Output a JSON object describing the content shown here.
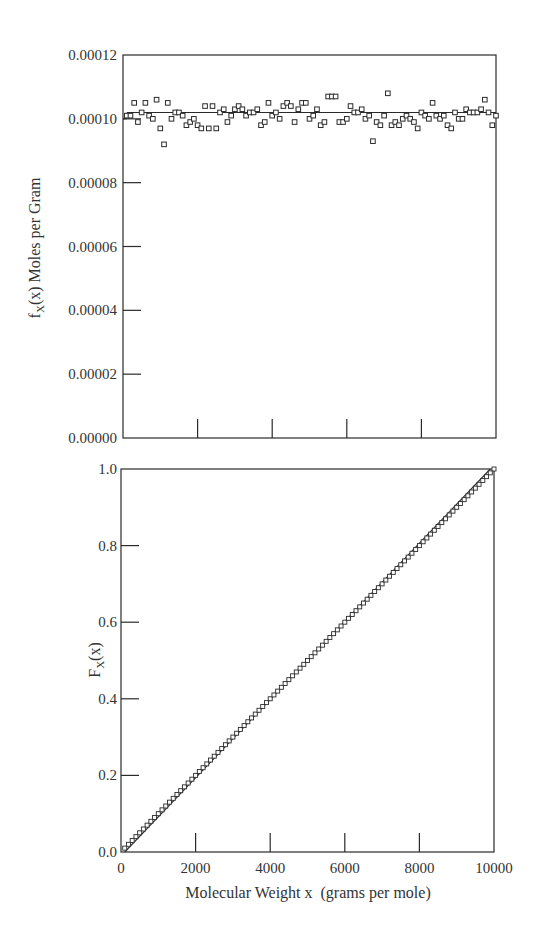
{
  "chart_data": [
    {
      "type": "scatter",
      "panel": "top",
      "title": "",
      "xlabel": "",
      "ylabel": "f_X(x) Moles per Gram",
      "ylabel_main": "f",
      "ylabel_sub": "X",
      "ylabel_rest": "(x) Moles per Gram",
      "xlim": [
        0,
        10000
      ],
      "ylim": [
        0,
        0.00012
      ],
      "yticks": [
        0.0,
        2e-05,
        4e-05,
        6e-05,
        8e-05,
        0.0001,
        0.00012
      ],
      "ytick_labels": [
        "0.00000",
        "0.00002",
        "0.00004",
        "0.00006",
        "0.00008",
        "0.00010",
        "0.00012"
      ],
      "xticks": [
        2000,
        4000,
        6000,
        8000
      ],
      "xtick_labels": [],
      "grid": false,
      "legend": null,
      "reference_line": {
        "y": 0.000102,
        "style": "solid",
        "note": "mean density line"
      },
      "reference_line_left_segment": {
        "x": [
          0,
          100
        ],
        "y": 0.0001
      },
      "series": [
        {
          "name": "sample density",
          "marker": "open-square",
          "x": [
            100,
            200,
            300,
            400,
            500,
            600,
            700,
            800,
            900,
            1000,
            1100,
            1200,
            1300,
            1400,
            1500,
            1600,
            1700,
            1800,
            1900,
            2000,
            2100,
            2200,
            2300,
            2400,
            2500,
            2600,
            2700,
            2800,
            2900,
            3000,
            3100,
            3200,
            3300,
            3400,
            3500,
            3600,
            3700,
            3800,
            3900,
            4000,
            4100,
            4200,
            4300,
            4400,
            4500,
            4600,
            4700,
            4800,
            4900,
            5000,
            5100,
            5200,
            5300,
            5400,
            5500,
            5600,
            5700,
            5800,
            5900,
            6000,
            6100,
            6200,
            6300,
            6400,
            6500,
            6600,
            6700,
            6800,
            6900,
            7000,
            7100,
            7200,
            7300,
            7400,
            7500,
            7600,
            7700,
            7800,
            7900,
            8000,
            8100,
            8200,
            8300,
            8400,
            8500,
            8600,
            8700,
            8800,
            8900,
            9000,
            9100,
            9200,
            9300,
            9400,
            9500,
            9600,
            9700,
            9800,
            9900,
            10000
          ],
          "values": [
            0.000101,
            0.000101,
            0.000105,
            9.9e-05,
            0.000102,
            0.000105,
            0.000101,
            0.0001,
            0.000106,
            9.7e-05,
            9.2e-05,
            0.000105,
            0.0001,
            0.000102,
            0.000102,
            0.000101,
            9.8e-05,
            9.9e-05,
            0.0001,
            9.8e-05,
            9.7e-05,
            0.000104,
            9.7e-05,
            0.000104,
            9.7e-05,
            0.000102,
            0.000103,
            9.9e-05,
            0.000101,
            0.000103,
            0.000104,
            0.000103,
            0.000101,
            0.000102,
            0.000102,
            0.000103,
            9.8e-05,
            9.9e-05,
            0.000105,
            0.000101,
            0.000102,
            0.0001,
            0.000104,
            0.000105,
            0.000104,
            9.9e-05,
            0.000103,
            0.000105,
            0.000105,
            0.0001,
            0.000101,
            0.000103,
            9.8e-05,
            9.9e-05,
            0.000107,
            0.000107,
            0.000107,
            9.9e-05,
            9.9e-05,
            0.0001,
            0.000104,
            0.000102,
            0.000102,
            0.000103,
            0.0001,
            0.000101,
            9.3e-05,
            9.9e-05,
            9.8e-05,
            0.000101,
            0.000108,
            9.8e-05,
            9.9e-05,
            9.8e-05,
            0.0001,
            0.000101,
            0.0001,
            9.9e-05,
            9.7e-05,
            0.000102,
            0.000101,
            0.0001,
            0.000105,
            0.000101,
            0.0001,
            0.000101,
            9.8e-05,
            9.7e-05,
            0.000102,
            0.0001,
            0.0001,
            0.000103,
            0.000102,
            0.000102,
            0.000102,
            0.000103,
            0.000106,
            0.000102,
            9.8e-05,
            0.000101
          ]
        }
      ]
    },
    {
      "type": "scatter",
      "panel": "bottom",
      "title": "",
      "xlabel": "Molecular Weight x  (grams per mole)",
      "ylabel": "F_X(x)",
      "ylabel_main": "F",
      "ylabel_sub": "X",
      "ylabel_rest": "(x)",
      "xlim": [
        0,
        10000
      ],
      "ylim": [
        0,
        1.0
      ],
      "yticks": [
        0.0,
        0.2,
        0.4,
        0.6,
        0.8,
        1.0
      ],
      "ytick_labels": [
        "0.0",
        "0.2",
        "0.4",
        "0.6",
        "0.8",
        "1.0"
      ],
      "xticks": [
        0,
        2000,
        4000,
        6000,
        8000,
        10000
      ],
      "xtick_labels": [
        "0",
        "2000",
        "4000",
        "6000",
        "8000",
        "10000"
      ],
      "grid": false,
      "legend": null,
      "reference_line": {
        "x": [
          100,
          9900
        ],
        "y": [
          0.0,
          1.0
        ],
        "style": "solid",
        "note": "theoretical CDF line"
      },
      "series": [
        {
          "name": "cumulative distribution",
          "marker": "open-square",
          "x_start": 100,
          "x_end": 10000,
          "x_step": 100,
          "y_start": 0.0101,
          "y_end": 1.0,
          "note": "approximately linear from (100, 0.01) to (10000, 1.0), lying slightly below the reference line near the top"
        }
      ]
    }
  ],
  "figure": {
    "top_panel": {
      "frame": {
        "left": 123,
        "top": 55,
        "right": 496,
        "bottom": 438
      }
    },
    "bottom_panel": {
      "frame": {
        "left": 121,
        "top": 469,
        "right": 494,
        "bottom": 852
      }
    },
    "colors": {
      "ink": "#2a2a2a",
      "background": "#ffffff"
    }
  }
}
